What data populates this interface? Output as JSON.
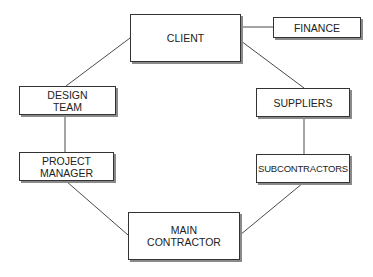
{
  "diagram": {
    "type": "relationship-network",
    "nodes": [
      {
        "id": "client",
        "label": "CLIENT"
      },
      {
        "id": "finance",
        "label": "FINANCE"
      },
      {
        "id": "design_team",
        "label": "DESIGN\nTEAM"
      },
      {
        "id": "suppliers",
        "label": "SUPPLIERS"
      },
      {
        "id": "project_manager",
        "label": "PROJECT\nMANAGER"
      },
      {
        "id": "subcontractors",
        "label": "SUBCONTRACTORS"
      },
      {
        "id": "main_contractor",
        "label": "MAIN\nCONTRACTOR"
      }
    ],
    "edges": [
      {
        "from": "client",
        "to": "finance"
      },
      {
        "from": "client",
        "to": "design_team"
      },
      {
        "from": "client",
        "to": "suppliers"
      },
      {
        "from": "design_team",
        "to": "project_manager"
      },
      {
        "from": "suppliers",
        "to": "subcontractors"
      },
      {
        "from": "project_manager",
        "to": "main_contractor"
      },
      {
        "from": "subcontractors",
        "to": "main_contractor"
      }
    ],
    "colors": {
      "line": "#4a4a4a",
      "border": "#333333",
      "shadow": "#8a8a8a",
      "text": "#222222",
      "background": "#ffffff"
    }
  }
}
